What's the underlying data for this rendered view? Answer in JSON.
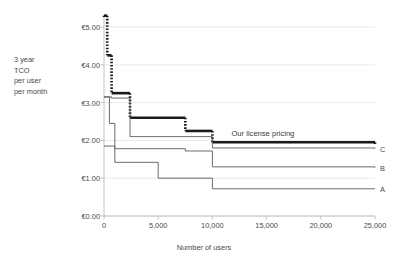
{
  "chart_data": {
    "type": "line",
    "subtype": "step",
    "title": "",
    "xlabel": "Number of users",
    "ylabel": "3 year TCO per user per month",
    "ylabel_lines": [
      "3 year",
      "TCO",
      "per user",
      "per month"
    ],
    "xlim": [
      0,
      25000
    ],
    "ylim": [
      0,
      5
    ],
    "xticks": [
      0,
      5000,
      10000,
      15000,
      20000,
      25000
    ],
    "xticklabels": [
      "0",
      "5,000",
      "10,000",
      "15,000",
      "20,000",
      "25,000"
    ],
    "yticks": [
      0,
      1,
      2,
      3,
      4,
      5
    ],
    "yticklabels": [
      "€0.00",
      "€1.00",
      "€2.00",
      "€3.00",
      "€4.00",
      "€5.00"
    ],
    "grid": true,
    "grid_axis": "y",
    "legend_position": "right-of-line-ends",
    "currency": "EUR",
    "annotations": [
      {
        "name": "our-license-pricing-annotation",
        "text": "Our license pricing",
        "x": 16000,
        "y": 2.18
      }
    ],
    "series": [
      {
        "name": "Our license pricing",
        "label": "",
        "style": "thick-solid-with-dotted-risers",
        "color": "#1a1a1a",
        "width": 2.6,
        "steps": [
          {
            "x": 0,
            "y": 5.3
          },
          {
            "x": 300,
            "y": 4.25
          },
          {
            "x": 700,
            "y": 3.25
          },
          {
            "x": 2400,
            "y": 2.6
          },
          {
            "x": 7500,
            "y": 2.25
          },
          {
            "x": 10000,
            "y": 1.95
          },
          {
            "x": 25000,
            "y": 1.9
          }
        ]
      },
      {
        "name": "C",
        "label": "C",
        "style": "thin-solid",
        "color": "#5a5a5a",
        "width": 0.9,
        "steps": [
          {
            "x": 0,
            "y": 3.15
          },
          {
            "x": 700,
            "y": 3.12
          },
          {
            "x": 2400,
            "y": 2.1
          },
          {
            "x": 10000,
            "y": 1.8
          },
          {
            "x": 25000,
            "y": 1.78
          }
        ]
      },
      {
        "name": "B",
        "label": "B",
        "style": "thin-solid",
        "color": "#5a5a5a",
        "width": 0.9,
        "steps": [
          {
            "x": 0,
            "y": 3.15
          },
          {
            "x": 500,
            "y": 2.45
          },
          {
            "x": 1000,
            "y": 1.78
          },
          {
            "x": 7500,
            "y": 1.72
          },
          {
            "x": 10000,
            "y": 1.3
          },
          {
            "x": 25000,
            "y": 1.28
          }
        ]
      },
      {
        "name": "A",
        "label": "A",
        "style": "thin-solid",
        "color": "#5a5a5a",
        "width": 0.9,
        "steps": [
          {
            "x": 0,
            "y": 1.85
          },
          {
            "x": 1000,
            "y": 1.42
          },
          {
            "x": 5000,
            "y": 1.0
          },
          {
            "x": 10000,
            "y": 0.72
          },
          {
            "x": 25000,
            "y": 0.72
          }
        ]
      }
    ],
    "series_end_labels": [
      {
        "label": "C",
        "y": 1.78
      },
      {
        "label": "B",
        "y": 1.28
      },
      {
        "label": "A",
        "y": 0.72
      }
    ],
    "colors": {
      "background": "#ffffff",
      "grid": "#e3e3e3",
      "axis": "#bdbdbd",
      "text": "#4a4a4a",
      "highlight_series": "#1a1a1a",
      "thin_series": "#5a5a5a"
    }
  }
}
